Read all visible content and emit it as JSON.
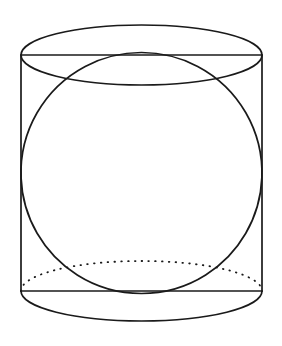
{
  "figure": {
    "background_color": "#ffffff",
    "stroke_color": "#1a1a1a",
    "canvas": {
      "width": 282,
      "height": 346
    },
    "shapes": {
      "cylinder": {
        "name": "cylinder",
        "axis_x": 141.5,
        "left_wall_x": 21,
        "right_wall_x": 262,
        "top_rim_y": 55,
        "bottom_rim_y": 291,
        "ellipse_rx": 120.5,
        "ellipse_ry": 30,
        "top_ellipse_style": "solid",
        "bottom_front_arc_style": "solid",
        "bottom_back_arc_style": "dotted"
      },
      "sphere": {
        "name": "inscribed-sphere",
        "center_x": 141.5,
        "center_y": 173,
        "radius": 120.5,
        "style": "solid"
      }
    },
    "paths": {
      "top_ellipse": "M 21 55 A 120.5 30 0 1 0 262 55 A 120.5 30 0 1 0 21 55 Z",
      "left_wall": "M 21 55 L 21 291",
      "right_wall": "M 262 55 L 262 291",
      "top_rim_chord": "M 21 55 L 262 55",
      "bottom_rim_chord": "M 21 291 L 262 291",
      "bottom_front_arc": "M 21 291 A 120.5 30 0 0 0 262 291",
      "bottom_back_arc": "M 21 291 A 120.5 30 0 0 1 262 291",
      "sphere_circle": "M 141.5 52.5 A 120.5 120.5 0 1 1 141.4 52.5 Z"
    }
  }
}
